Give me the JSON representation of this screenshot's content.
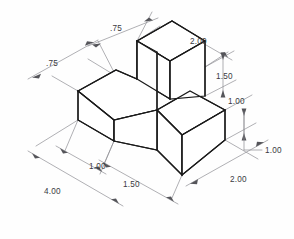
{
  "drawing": {
    "type": "isometric-technical-drawing",
    "title": "",
    "background_color": "#fefefe",
    "object_line_color": "#1a1a1a",
    "dimension_line_color": "#8e8e93",
    "text_color": "#3a3a3e",
    "units": "inches",
    "object_description": "Stepped L-shaped solid block shown in isometric projection"
  },
  "dimensions": [
    {
      "id": "top-left-width",
      "label": ".75",
      "x": 110,
      "y": 31,
      "anchor": "start"
    },
    {
      "id": "upper-left-depth",
      "label": ".75",
      "x": 46,
      "y": 66,
      "anchor": "start"
    },
    {
      "id": "top-block-length",
      "label": "2.00",
      "x": 190,
      "y": 44,
      "anchor": "start"
    },
    {
      "id": "top-block-height",
      "label": "1.50",
      "x": 216,
      "y": 79,
      "anchor": "start"
    },
    {
      "id": "step-height",
      "label": "1.00",
      "x": 228,
      "y": 104,
      "anchor": "start"
    },
    {
      "id": "base-height",
      "label": "1.00",
      "x": 265,
      "y": 153,
      "anchor": "start"
    },
    {
      "id": "left-arm-width",
      "label": "1.00",
      "x": 89,
      "y": 169,
      "anchor": "start"
    },
    {
      "id": "front-notch-width",
      "label": "1.50",
      "x": 123,
      "y": 187,
      "anchor": "start"
    },
    {
      "id": "overall-length",
      "label": "4.00",
      "x": 44,
      "y": 194,
      "anchor": "start"
    },
    {
      "id": "base-depth",
      "label": "2.00",
      "x": 230,
      "y": 182,
      "anchor": "start"
    }
  ],
  "geometry": {
    "vertices_note": "Isometric projection, 30 degree axes",
    "faces": [
      "top-block-top-face",
      "top-block-left-face",
      "top-block-front-face",
      "left-arm-top-face",
      "left-arm-left-face",
      "left-arm-front-face",
      "base-top-face",
      "base-left-face",
      "base-front-face"
    ]
  }
}
